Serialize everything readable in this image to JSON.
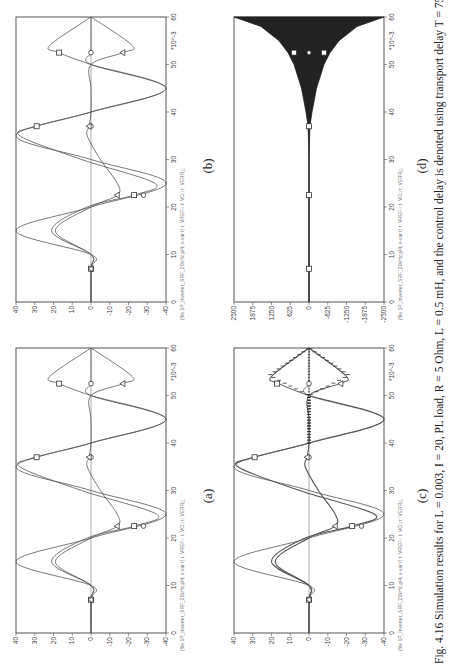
{
  "figure": {
    "orientation": "rotated-90-ccw",
    "caption": "Fig. 4.16  Simulation results for L = 0.003, I = 20, PL load, R = 5 Ohm, L = 0.5 mH, and the control delay is denoted using transport delay T = 75s",
    "panels": [
      {
        "id": "a",
        "label": "(a)"
      },
      {
        "id": "b",
        "label": "(b)"
      },
      {
        "id": "c",
        "label": "(c)"
      },
      {
        "id": "d",
        "label": "(d)"
      }
    ],
    "legend_text": "(file 1P_Inverter_SRF_20kHz.pl4; x-var t)  t: VREF○  t: VC□  t: VERR△"
  },
  "chart_data": [
    {
      "panel": "(a)",
      "type": "line",
      "title": "",
      "xlabel": "t (*10^-3 s)",
      "ylabel": "",
      "x_ticks": [
        0,
        10,
        20,
        30,
        40,
        50,
        60
      ],
      "x_multiplier": "*10^-3",
      "y_ticks": [
        40,
        30,
        20,
        10,
        0,
        -10,
        -20,
        -30,
        -40
      ],
      "xlim": [
        0,
        60
      ],
      "ylim": [
        -40,
        40
      ],
      "legend": [
        "VREF (circle)",
        "VC (square)",
        "VERR (triangle)"
      ],
      "series": [
        {
          "name": "VREF",
          "marker": "circle",
          "x": [
            0,
            7,
            10,
            15,
            20,
            25,
            30,
            35,
            40,
            45,
            50,
            52.5,
            55,
            60
          ],
          "y": [
            0,
            0,
            0,
            40,
            0,
            -40,
            0,
            40,
            0,
            -40,
            0,
            0,
            0,
            0
          ]
        },
        {
          "name": "VC",
          "marker": "square",
          "x": [
            0,
            7,
            10,
            15,
            20,
            22.5,
            25,
            30,
            35,
            37,
            40,
            45,
            50,
            52.5,
            54,
            60
          ],
          "y": [
            0,
            0,
            0,
            21,
            2,
            -23,
            -35,
            5,
            38,
            29,
            0,
            -40,
            0,
            17,
            22,
            0
          ]
        },
        {
          "name": "VERR",
          "marker": "triangle",
          "x": [
            0,
            7,
            10,
            15,
            20,
            22.5,
            25,
            30,
            35,
            37,
            40,
            45,
            50,
            52.5,
            54,
            60
          ],
          "y": [
            0,
            0,
            0,
            19,
            0,
            -14,
            -14,
            -5,
            2,
            1,
            0,
            0,
            0,
            -17,
            -22,
            0
          ]
        }
      ]
    },
    {
      "panel": "(b)",
      "type": "line",
      "xlabel": "t (*10^-3 s)",
      "x_ticks": [
        0,
        10,
        20,
        30,
        40,
        50,
        60
      ],
      "x_multiplier": "*10^-3",
      "y_ticks": [
        40,
        30,
        20,
        10,
        0,
        -10,
        -20,
        -30,
        -40
      ],
      "xlim": [
        0,
        60
      ],
      "ylim": [
        -40,
        40
      ],
      "legend": [
        "VREF (circle)",
        "VC (square)",
        "VERR (triangle)"
      ],
      "series": [
        {
          "name": "VREF",
          "marker": "circle",
          "x": [
            0,
            7,
            10,
            15,
            20,
            25,
            30,
            35,
            40,
            45,
            50,
            52.5,
            55,
            60
          ],
          "y": [
            0,
            0,
            0,
            40,
            0,
            -40,
            0,
            40,
            0,
            -40,
            0,
            0,
            0,
            0
          ]
        },
        {
          "name": "VC",
          "marker": "square",
          "x": [
            0,
            7,
            10,
            15,
            20,
            22.5,
            25,
            30,
            35,
            37,
            40,
            45,
            50,
            52.5,
            54,
            60
          ],
          "y": [
            0,
            0,
            0,
            21,
            2,
            -23,
            -34,
            5,
            38,
            29,
            0,
            -40,
            0,
            17,
            22,
            0
          ]
        },
        {
          "name": "VERR",
          "marker": "triangle",
          "x": [
            0,
            7,
            10,
            15,
            20,
            22.5,
            25,
            30,
            35,
            37,
            40,
            45,
            50,
            52.5,
            54,
            60
          ],
          "y": [
            0,
            0,
            0,
            19,
            0,
            -14,
            -14,
            -5,
            2,
            1,
            0,
            0,
            0,
            -17,
            -22,
            0
          ]
        }
      ]
    },
    {
      "panel": "(c)",
      "type": "line",
      "xlabel": "t (*10^-3 s)",
      "x_ticks": [
        0,
        10,
        20,
        30,
        40,
        50,
        60
      ],
      "x_multiplier": "*10^-3",
      "y_ticks": [
        40,
        30,
        20,
        10,
        0,
        -10,
        -20,
        -30,
        -40
      ],
      "xlim": [
        0,
        60
      ],
      "ylim": [
        -40,
        40
      ],
      "legend": [
        "VREF (circle)",
        "VC (square)",
        "VERR (triangle)"
      ],
      "notes": "VC and VERR show high-frequency ripple envelope after ~40ms",
      "series": [
        {
          "name": "VREF",
          "marker": "circle",
          "x": [
            0,
            7,
            10,
            15,
            20,
            25,
            30,
            35,
            40,
            45,
            50,
            52.5,
            55,
            60
          ],
          "y": [
            0,
            0,
            0,
            40,
            0,
            -40,
            0,
            40,
            0,
            -40,
            0,
            0,
            0,
            0
          ]
        },
        {
          "name": "VC",
          "marker": "square",
          "x": [
            0,
            7,
            10,
            15,
            20,
            22.5,
            25,
            30,
            35,
            37,
            40,
            45,
            50,
            52.5,
            54,
            60
          ],
          "y": [
            0,
            0,
            0,
            20,
            2,
            -23,
            -35,
            5,
            38,
            29,
            0,
            -40,
            0,
            16,
            20,
            0
          ]
        },
        {
          "name": "VERR",
          "marker": "triangle",
          "x": [
            0,
            7,
            10,
            15,
            20,
            22.5,
            25,
            30,
            35,
            37,
            40,
            45,
            50,
            52.5,
            54,
            60
          ],
          "y": [
            0,
            0,
            0,
            18,
            0,
            -14,
            -14,
            -5,
            2,
            1,
            0,
            0,
            0,
            -16,
            -20,
            0
          ]
        }
      ]
    },
    {
      "panel": "(d)",
      "type": "line",
      "xlabel": "t (*10^-3 s)",
      "x_ticks": [
        0,
        10,
        20,
        30,
        40,
        50,
        60
      ],
      "x_multiplier": "*10^-3",
      "y_ticks": [
        2500,
        1875,
        1250,
        625,
        0,
        -625,
        -1250,
        -1875,
        -2500
      ],
      "xlim": [
        0,
        60
      ],
      "ylim": [
        -2500,
        2500
      ],
      "legend": [
        "VREF (circle)",
        "VC (square)",
        "VERR (triangle)"
      ],
      "notes": "Unstable: oscillation envelope grows exponentially from ~37ms, reaching about ±2500 at 60ms",
      "series": [
        {
          "name": "envelope_upper",
          "x": [
            0,
            30,
            37,
            40,
            45,
            50,
            52.5,
            55,
            58,
            60
          ],
          "y": [
            0,
            0,
            30,
            100,
            250,
            500,
            700,
            1000,
            1600,
            2500
          ]
        },
        {
          "name": "envelope_lower",
          "x": [
            0,
            30,
            37,
            40,
            45,
            50,
            52.5,
            55,
            58,
            60
          ],
          "y": [
            0,
            0,
            -30,
            -100,
            -250,
            -500,
            -700,
            -1000,
            -1600,
            -2500
          ]
        }
      ]
    }
  ]
}
